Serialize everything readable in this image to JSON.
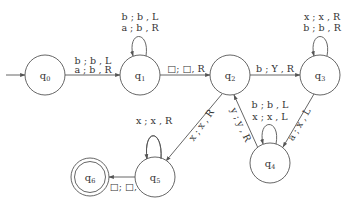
{
  "diagram": {
    "type": "turing-machine-state-diagram",
    "states": [
      {
        "id": "q0",
        "name": "q",
        "sub": "0",
        "initial": true,
        "accepting": false
      },
      {
        "id": "q1",
        "name": "q",
        "sub": "1",
        "initial": false,
        "accepting": false
      },
      {
        "id": "q2",
        "name": "q",
        "sub": "2",
        "initial": false,
        "accepting": false
      },
      {
        "id": "q3",
        "name": "q",
        "sub": "3",
        "initial": false,
        "accepting": false
      },
      {
        "id": "q4",
        "name": "q",
        "sub": "4",
        "initial": false,
        "accepting": false
      },
      {
        "id": "q5",
        "name": "q",
        "sub": "5",
        "initial": false,
        "accepting": false
      },
      {
        "id": "q6",
        "name": "q",
        "sub": "6",
        "initial": false,
        "accepting": true
      }
    ],
    "transitions": {
      "q0_q1": {
        "line1": "b ; b , L",
        "line2": "a ; b , R"
      },
      "q1_q1": {
        "line1": "b ; b , L",
        "line2": "a ; b , R"
      },
      "q1_q2": {
        "label": "□; □, R"
      },
      "q2_q3": {
        "label": "b ; Y , R"
      },
      "q3_q3": {
        "line1": "x ; x , R",
        "line2": "b ; b , R"
      },
      "q3_q4": {
        "label": "a ; x , L"
      },
      "q4_q4": {
        "line1": "b ; b , L",
        "line2": "x ; x , L"
      },
      "q4_q2": {
        "label": "y ; y , R"
      },
      "q2_q5": {
        "label": "x ; x , R"
      },
      "q5_q5": {
        "label": "x ; x , R"
      },
      "q5_q6": {
        "label": "□; □, L"
      }
    }
  }
}
